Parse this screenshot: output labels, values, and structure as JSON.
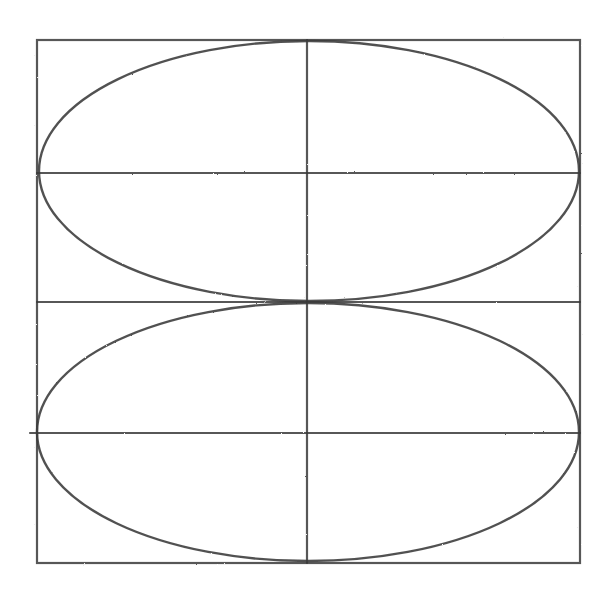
{
  "drawing": {
    "description": "Pencil sketch: square frame divided into a grid with two stacked ellipses",
    "stroke_color": "#3a3a3a",
    "background": "#ffffff",
    "frame": {
      "x1": 37,
      "y1": 40,
      "x2": 580,
      "y2": 563
    },
    "horizontal_lines_y": [
      173,
      302,
      433
    ],
    "vertical_center_x": 307,
    "ellipses": [
      {
        "name": "upper",
        "cx": 309,
        "cy": 171,
        "rx": 270,
        "ry": 130
      },
      {
        "name": "lower",
        "cx": 308,
        "cy": 432,
        "rx": 271,
        "ry": 129
      }
    ]
  }
}
